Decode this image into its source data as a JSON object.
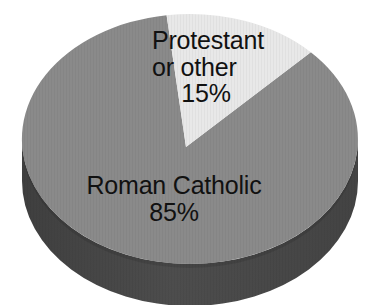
{
  "chart_data": {
    "type": "pie",
    "title": "",
    "subtitle": "",
    "xlabel": "",
    "ylabel": "",
    "grid": false,
    "legend_position": "none",
    "style": "3d-pie",
    "categories": [
      "Roman Catholic",
      "Protestant or other"
    ],
    "values": [
      85,
      15
    ],
    "units": "percent",
    "slices": [
      {
        "label": "Roman Catholic",
        "value": 85,
        "value_text": "85%",
        "color": "#8a8a8a",
        "label_lines": [
          "Roman Catholic",
          "85%"
        ]
      },
      {
        "label": "Protestant or other",
        "value": 15,
        "value_text": "15%",
        "color": "#e8e8e8",
        "label_lines": [
          "Protestant",
          "or other",
          "15%"
        ]
      }
    ],
    "annotations": []
  },
  "labels": {
    "light_slice": {
      "line1": "Protestant",
      "line2": "or other",
      "percent": "15%"
    },
    "dark_slice": {
      "line1": "Roman Catholic",
      "percent": "85%"
    }
  },
  "colors": {
    "background": "#ffffff",
    "slice_major": "#8a8a8a",
    "slice_minor": "#e8e8e8",
    "side_major": "#4a4a4a",
    "side_minor": "#8f8f8f",
    "text": "#111111"
  }
}
